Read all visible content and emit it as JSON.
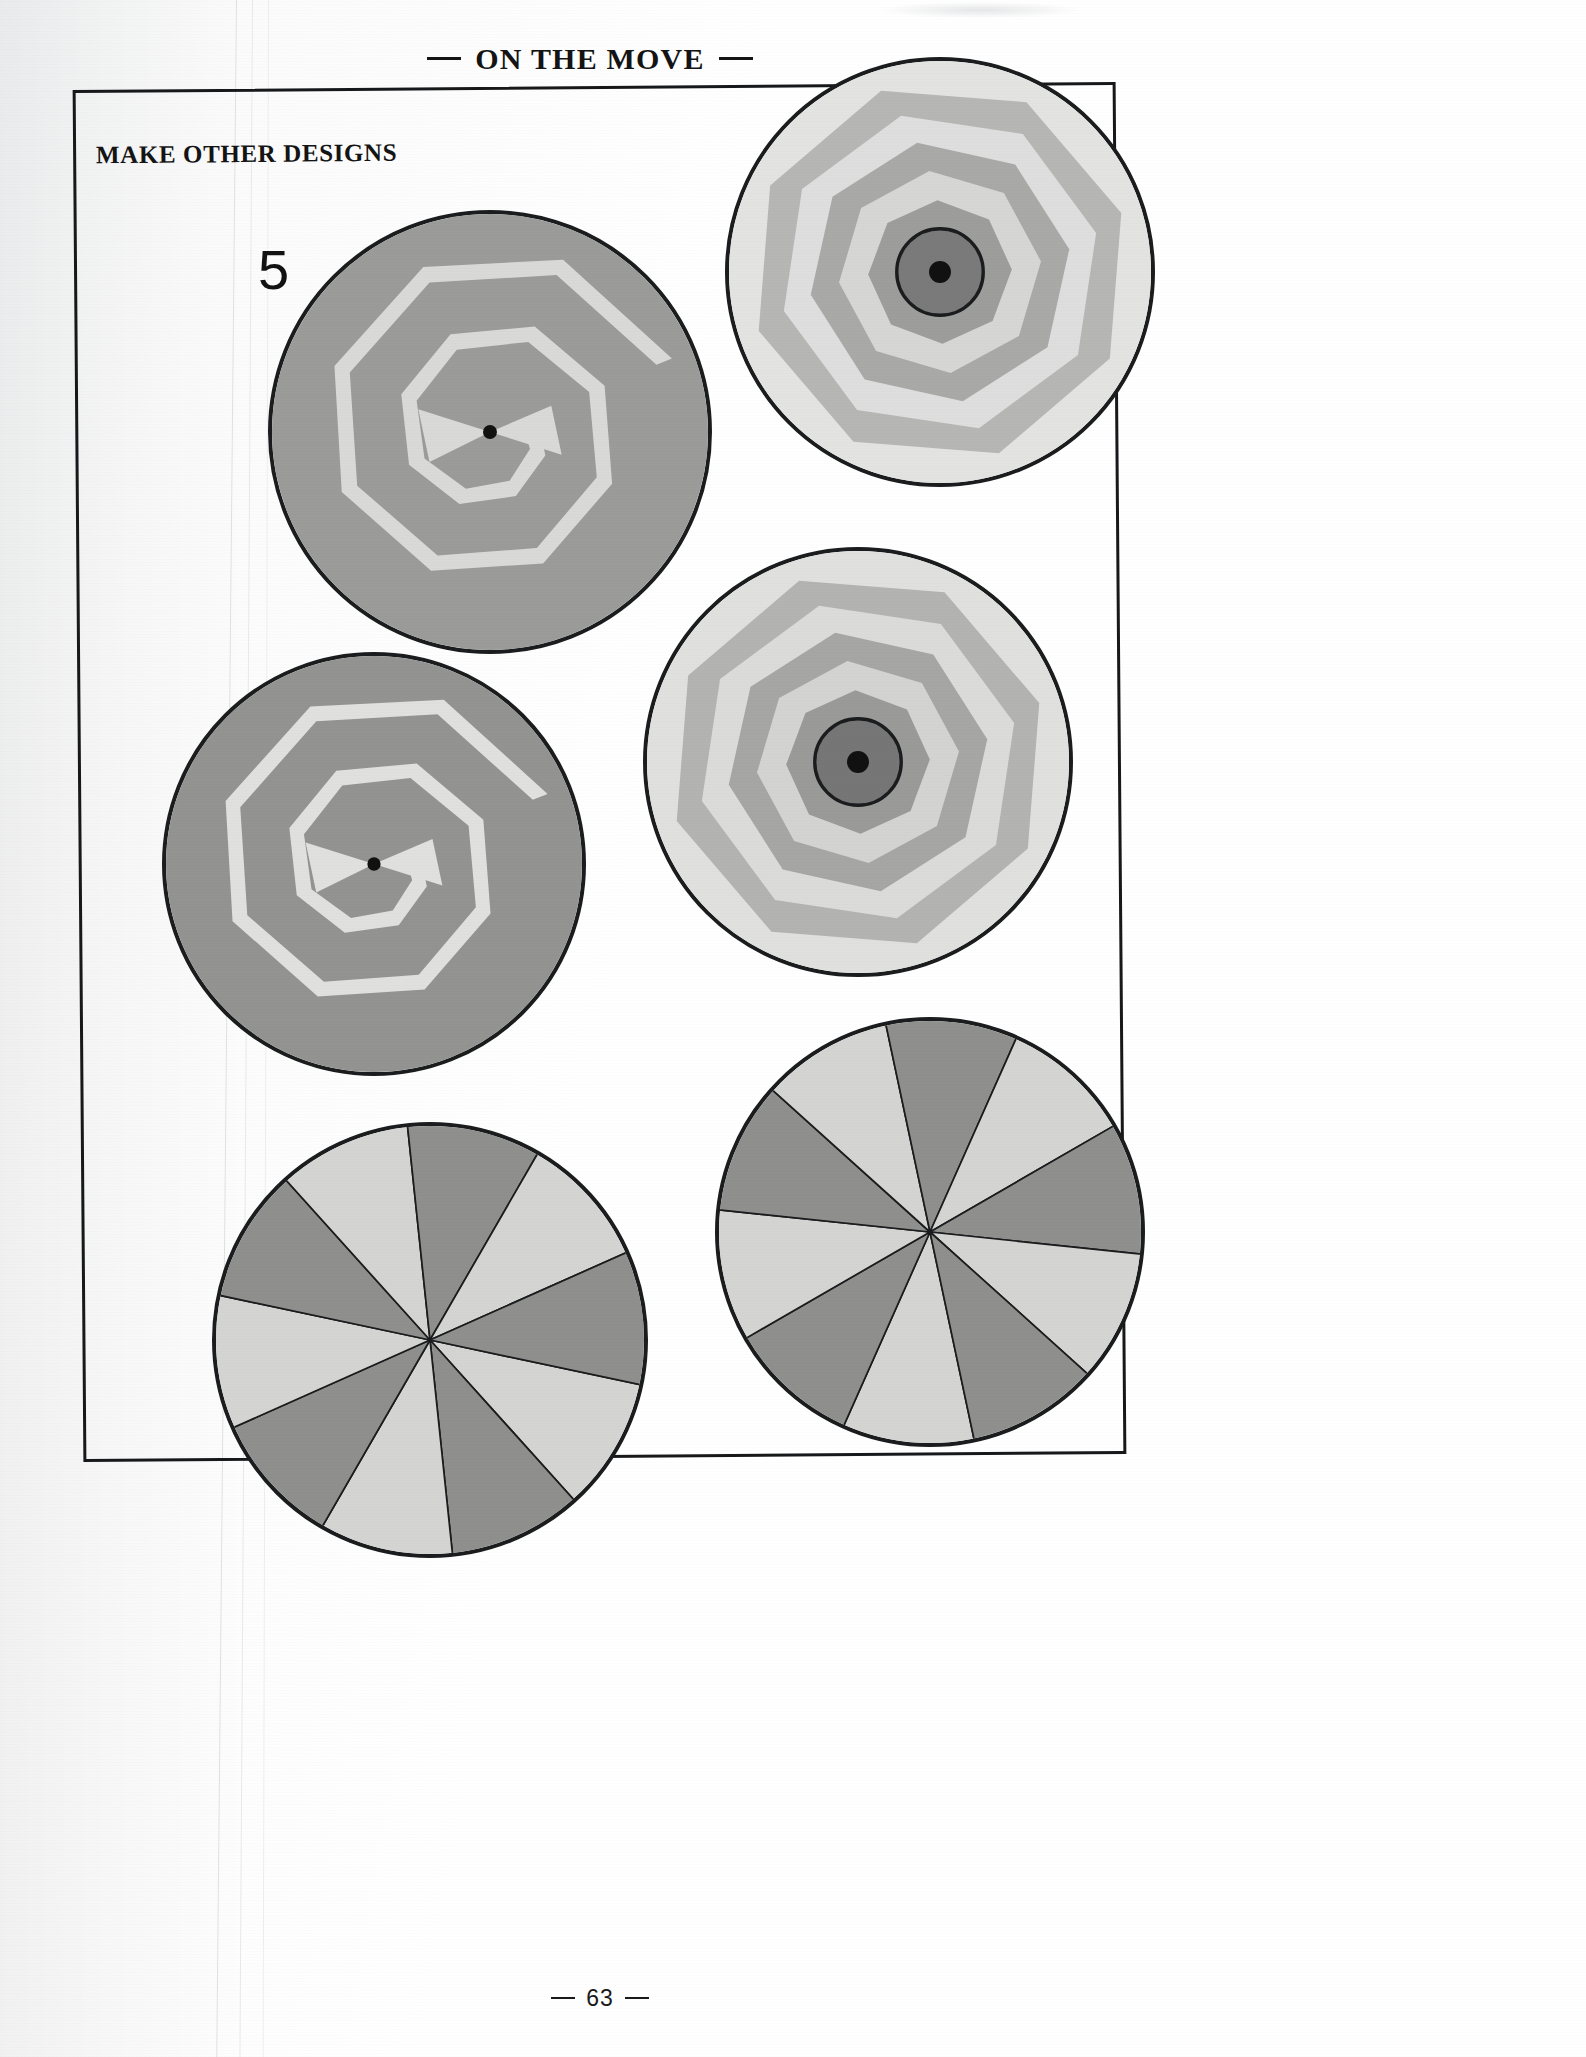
{
  "page": {
    "running_head": "ON THE MOVE",
    "section_heading": "MAKE OTHER DESIGNS",
    "step_number": "5",
    "page_number": "63",
    "background_color": "#ffffff",
    "frame_color": "#16181a",
    "text_color": "#141414"
  },
  "palette": {
    "outline": "#1a1c1e",
    "white": "#f7f7f5",
    "very_light_gray": "#e7e7e5",
    "light_gray": "#d2d2d0",
    "mid_light_gray": "#bdbdbb",
    "mid_gray": "#a8a8a6",
    "gray": "#999997",
    "dark_gray": "#808080",
    "darker_gray": "#6e6e6e",
    "center_dot": "#111111"
  },
  "chart_data": {
    "type": "diagram",
    "discs": [
      {
        "id": "disc-spiral-top-left",
        "label": "Gray disc with light spiral band and bowtie",
        "pattern": "spiral-octagon",
        "cx": 490,
        "cy": 432,
        "r": 222,
        "base_color": "#9b9b99",
        "band_color": "#d9d9d7",
        "band_count": 2,
        "center_dot": true,
        "bowtie": true
      },
      {
        "id": "disc-rings-top-right",
        "label": "Concentric octagon rings with dark center circle",
        "pattern": "concentric-octagons",
        "cx": 940,
        "cy": 272,
        "r": 215,
        "ring_colors": [
          "#e3e3e1",
          "#b6b6b4",
          "#dedede",
          "#a9a9a7",
          "#d6d6d4",
          "#9d9d9b",
          "#cfcfcd"
        ],
        "center_circle_color": "#7a7a7a",
        "center_dot": true
      },
      {
        "id": "disc-spiral-mid-left",
        "label": "Gray disc with light spiral band and bowtie",
        "pattern": "spiral-octagon",
        "cx": 374,
        "cy": 864,
        "r": 212,
        "base_color": "#939391",
        "band_color": "#e0e0de",
        "band_count": 2,
        "center_dot": true,
        "bowtie": true
      },
      {
        "id": "disc-rings-mid-right",
        "label": "Concentric octagon rings with dark center circle",
        "pattern": "concentric-octagons",
        "cx": 858,
        "cy": 762,
        "r": 215,
        "ring_colors": [
          "#e0e0de",
          "#b3b3b1",
          "#dbdbd9",
          "#a6a6a4",
          "#d3d3d1",
          "#9a9a98",
          "#cccccb"
        ],
        "center_circle_color": "#767676",
        "center_dot": true
      },
      {
        "id": "disc-pinwheel-bottom-left",
        "label": "Ten-sector pinwheel of alternating light and dark gray wedges",
        "pattern": "pinwheel",
        "cx": 430,
        "cy": 1340,
        "r": 218,
        "sector_count": 10,
        "start_angle": 12,
        "colors": [
          "#d4d4d2",
          "#8f8f8d"
        ]
      },
      {
        "id": "disc-pinwheel-bottom-right",
        "label": "Ten-sector pinwheel of alternating light and dark gray wedges",
        "pattern": "pinwheel",
        "cx": 930,
        "cy": 1232,
        "r": 215,
        "sector_count": 10,
        "start_angle": 78,
        "colors": [
          "#d4d4d2",
          "#8f8f8d"
        ]
      }
    ]
  }
}
